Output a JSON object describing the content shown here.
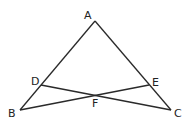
{
  "diagram": {
    "points": {
      "A": {
        "label": "A",
        "x": 95,
        "y": 21,
        "lx": 84,
        "ly": 19
      },
      "B": {
        "label": "B",
        "x": 20,
        "y": 110,
        "lx": 8,
        "ly": 117
      },
      "C": {
        "label": "C",
        "x": 171,
        "y": 110,
        "lx": 174,
        "ly": 117
      },
      "D": {
        "label": "D",
        "x": 41,
        "y": 85,
        "lx": 31,
        "ly": 85
      },
      "E": {
        "label": "E",
        "x": 149,
        "y": 85,
        "lx": 152,
        "ly": 86
      },
      "F": {
        "label": "F",
        "x": 95,
        "y": 96,
        "lx": 92,
        "ly": 107
      }
    },
    "segments": [
      [
        "A",
        "B"
      ],
      [
        "A",
        "C"
      ],
      [
        "B",
        "E"
      ],
      [
        "C",
        "D"
      ]
    ]
  }
}
